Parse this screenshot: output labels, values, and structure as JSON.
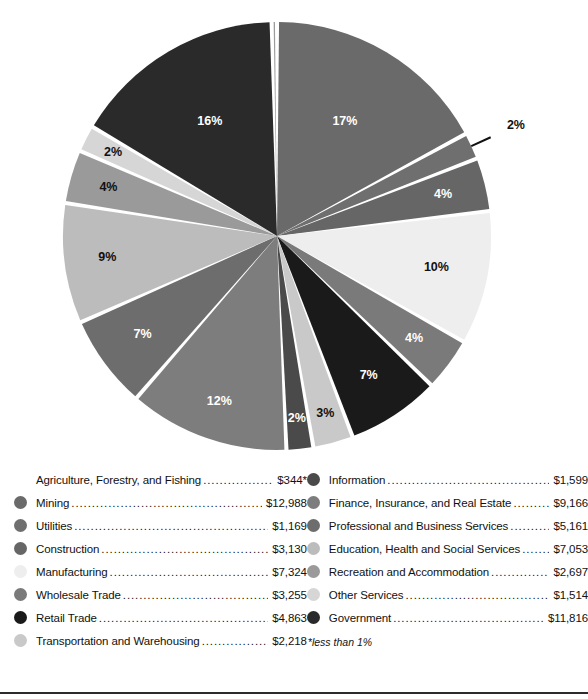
{
  "chart_data": {
    "type": "pie",
    "title": "",
    "unit": "millions of dollars",
    "center": {
      "x": 277,
      "y": 236
    },
    "radius": 214,
    "start_angle_deg": -90,
    "gap_deg": 1.1,
    "footnote": "*less than 1%",
    "legend_position": "below",
    "categories": [
      "Agriculture, Forestry, and Fishing",
      "Mining",
      "Utilities",
      "Construction",
      "Manufacturing",
      "Wholesale Trade",
      "Retail Trade",
      "Transportation and Warehousing",
      "Information",
      "Finance, Insurance, and Real Estate",
      "Professional and Business Services",
      "Education, Health and Social Services",
      "Recreation and Accommodation",
      "Other Services",
      "Government"
    ],
    "values": [
      344,
      12988,
      1169,
      3130,
      7324,
      3255,
      4863,
      2218,
      1599,
      9166,
      5161,
      7053,
      2697,
      1514,
      11816
    ],
    "value_labels": [
      "$344*",
      "$12,988",
      "$1,169",
      "$3,130",
      "$7,324",
      "$3,255",
      "$4,863",
      "$2,218",
      "$1,599",
      "$9,166",
      "$5,161",
      "$7,053",
      "$2,697",
      "$1,514",
      "$11,816"
    ],
    "percent_labels": [
      "",
      "17%",
      "2%",
      "4%",
      "10%",
      "4%",
      "7%",
      "3%",
      "2%",
      "12%",
      "7%",
      "9%",
      "4%",
      "2%",
      "16%"
    ],
    "colors": [
      "#9b9b9b",
      "#6a6a6a",
      "#6f6f6f",
      "#666666",
      "#eeeeee",
      "#7a7a7a",
      "#1a1a1a",
      "#c9c9c9",
      "#4a4a4a",
      "#7d7d7d",
      "#6d6d6d",
      "#bcbcbc",
      "#9a9a9a",
      "#d6d6d6",
      "#2a2a2a"
    ],
    "slices": [
      {
        "name": "Mining",
        "percent": 17,
        "color": "#6a6a6a",
        "label": "17%",
        "label_color": "light",
        "label_r": 0.62,
        "leader": false
      },
      {
        "name": "Utilities",
        "percent": 2,
        "color": "#6f6f6f",
        "label": "2%",
        "label_color": "dark",
        "label_r": 1.23,
        "leader": true
      },
      {
        "name": "Construction",
        "percent": 4,
        "color": "#666666",
        "label": "4%",
        "label_color": "light",
        "label_r": 0.8,
        "leader": false
      },
      {
        "name": "Manufacturing",
        "percent": 10,
        "color": "#eeeeee",
        "label": "10%",
        "label_color": "dark",
        "label_r": 0.76,
        "leader": false
      },
      {
        "name": "Wholesale Trade",
        "percent": 4,
        "color": "#7a7a7a",
        "label": "4%",
        "label_color": "light",
        "label_r": 0.8,
        "leader": false
      },
      {
        "name": "Retail Trade",
        "percent": 7,
        "color": "#1a1a1a",
        "label": "7%",
        "label_color": "light",
        "label_r": 0.78,
        "leader": false
      },
      {
        "name": "Transportation and Warehousing",
        "percent": 3,
        "color": "#c9c9c9",
        "label": "3%",
        "label_color": "dark",
        "label_r": 0.86,
        "leader": false
      },
      {
        "name": "Information",
        "percent": 2,
        "color": "#4a4a4a",
        "label": "2%",
        "label_color": "light",
        "label_r": 0.86,
        "leader": false
      },
      {
        "name": "Finance, Insurance, and Real Estate",
        "percent": 12,
        "color": "#7d7d7d",
        "label": "12%",
        "label_color": "light",
        "label_r": 0.82,
        "leader": false
      },
      {
        "name": "Professional and Business Services",
        "percent": 7,
        "color": "#6d6d6d",
        "label": "7%",
        "label_color": "light",
        "label_r": 0.78,
        "leader": false
      },
      {
        "name": "Education, Health and Social Services",
        "percent": 9,
        "color": "#bcbcbc",
        "label": "9%",
        "label_color": "dark",
        "label_r": 0.8,
        "leader": false
      },
      {
        "name": "Recreation and Accommodation",
        "percent": 4,
        "color": "#9a9a9a",
        "label": "4%",
        "label_color": "dark",
        "label_r": 0.82,
        "leader": false
      },
      {
        "name": "Other Services",
        "percent": 2,
        "color": "#d6d6d6",
        "label": "2%",
        "label_color": "dark",
        "label_r": 0.86,
        "leader": false
      },
      {
        "name": "Government",
        "percent": 16,
        "color": "#2a2a2a",
        "label": "16%",
        "label_color": "light",
        "label_r": 0.62,
        "leader": false
      },
      {
        "name": "Agriculture, Forestry, and Fishing",
        "percent": 0.4,
        "color": "#9b9b9b",
        "label": "",
        "label_color": "dark",
        "label_r": 0.9,
        "leader": false
      }
    ]
  },
  "legend": {
    "left_column": [
      {
        "label": "Agriculture, Forestry, and Fishing",
        "value": "$344*",
        "color": "",
        "has_swatch": false
      },
      {
        "label": "Mining",
        "value": "$12,988",
        "color": "#6a6a6a",
        "has_swatch": true
      },
      {
        "label": "Utilities",
        "value": "$1,169",
        "color": "#6f6f6f",
        "has_swatch": true
      },
      {
        "label": "Construction",
        "value": "$3,130",
        "color": "#666666",
        "has_swatch": true
      },
      {
        "label": "Manufacturing",
        "value": "$7,324",
        "color": "#eeeeee",
        "has_swatch": true
      },
      {
        "label": "Wholesale Trade",
        "value": "$3,255",
        "color": "#7a7a7a",
        "has_swatch": true
      },
      {
        "label": "Retail Trade",
        "value": "$4,863",
        "color": "#1a1a1a",
        "has_swatch": true
      },
      {
        "label": "Transportation and Warehousing",
        "value": "$2,218",
        "color": "#c9c9c9",
        "has_swatch": true
      }
    ],
    "right_column": [
      {
        "label": "Information",
        "value": "$1,599",
        "color": "#4a4a4a",
        "has_swatch": true
      },
      {
        "label": "Finance, Insurance, and Real Estate",
        "value": "$9,166",
        "color": "#7d7d7d",
        "has_swatch": true
      },
      {
        "label": "Professional and Business Services",
        "value": "$5,161",
        "color": "#6d6d6d",
        "has_swatch": true
      },
      {
        "label": "Education, Health and Social Services",
        "value": "$7,053",
        "color": "#bcbcbc",
        "has_swatch": true
      },
      {
        "label": "Recreation and Accommodation",
        "value": "$2,697",
        "color": "#9a9a9a",
        "has_swatch": true
      },
      {
        "label": "Other Services",
        "value": "$1,514",
        "color": "#d6d6d6",
        "has_swatch": true
      },
      {
        "label": "Government",
        "value": "$11,816",
        "color": "#2a2a2a",
        "has_swatch": true
      }
    ],
    "footnote": "*less than 1%"
  }
}
